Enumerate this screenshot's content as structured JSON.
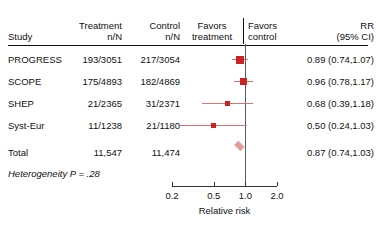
{
  "header": {
    "study_label": "Study",
    "treatment_line1": "Treatment",
    "treatment_line2": "n/N",
    "control_line1": "Control",
    "control_line2": "n/N",
    "favors_treatment_line1": "Favors",
    "favors_treatment_line2": "treatment",
    "favors_control_line1": "Favors",
    "favors_control_line2": "control",
    "rr_line1": "RR",
    "rr_line2": "(95% CI)"
  },
  "rows": [
    {
      "study": "PROGRESS",
      "treatment": "193/3051",
      "control": "217/3054",
      "rr_text": "0.89 (0.74,1.07)",
      "estimate": 0.89,
      "ci_low": 0.74,
      "ci_high": 1.07,
      "weight": 1.0,
      "type": "study"
    },
    {
      "study": "SCOPE",
      "treatment": "175/4893",
      "control": "182/4869",
      "rr_text": "0.96 (0.78,1.17)",
      "estimate": 0.96,
      "ci_low": 0.78,
      "ci_high": 1.17,
      "weight": 0.95,
      "type": "study"
    },
    {
      "study": "SHEP",
      "treatment": "21/2365",
      "control": "31/2371",
      "rr_text": "0.68 (0.39,1.18)",
      "estimate": 0.68,
      "ci_low": 0.39,
      "ci_high": 1.18,
      "weight": 0.45,
      "type": "study"
    },
    {
      "study": "Syst-Eur",
      "treatment": "11/1238",
      "control": "21/1180",
      "rr_text": "0.50 (0.24,1.03)",
      "estimate": 0.5,
      "ci_low": 0.24,
      "ci_high": 1.03,
      "weight": 0.38,
      "type": "study"
    },
    {
      "study": "Total",
      "treatment": "11,547",
      "control": "11,474",
      "rr_text": "0.87 (0.74,1.03)",
      "estimate": 0.87,
      "ci_low": 0.74,
      "ci_high": 1.03,
      "weight": 1.0,
      "type": "summary"
    }
  ],
  "heterogeneity": "Heterogeneity P = .28",
  "axis": {
    "title": "Relative risk",
    "ticks": [
      0.2,
      0.5,
      1.0,
      2.0
    ],
    "tick_labels": [
      "0.2",
      "0.5",
      "1.0",
      "2.0"
    ],
    "min": 0.2,
    "max": 2.0,
    "scale": "log",
    "null_value": 1.0
  },
  "colors": {
    "estimate_box": "#cc2222",
    "ci_line": "#d9736e",
    "diamond": "#dfa09c",
    "null_line": "#555a5c",
    "text": "#111111",
    "rule": "#111111"
  }
}
